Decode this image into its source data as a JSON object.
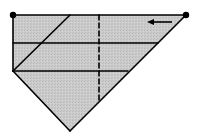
{
  "diagram": {
    "width": 198,
    "height": 138,
    "colors": {
      "background": "#ffffff",
      "fill": "#c8c8c8",
      "stroke": "#000000"
    },
    "shape": {
      "name": "pentagon-region",
      "points": [
        [
          13,
          15
        ],
        [
          186,
          15
        ],
        [
          70,
          131
        ],
        [
          13,
          71
        ]
      ]
    },
    "endpoints": [
      {
        "name": "left-endpoint-dot",
        "x": 13,
        "y": 15,
        "r": 3.2
      },
      {
        "name": "right-endpoint-dot",
        "x": 186,
        "y": 15,
        "r": 3.2
      }
    ],
    "lines": [
      {
        "name": "top-edge",
        "x1": 13,
        "y1": 15,
        "x2": 186,
        "y2": 15,
        "dashed": false
      },
      {
        "name": "left-edge",
        "x1": 13,
        "y1": 15,
        "x2": 13,
        "y2": 71,
        "dashed": false
      },
      {
        "name": "right-diagonal-edge",
        "x1": 186,
        "y1": 15,
        "x2": 70,
        "y2": 131,
        "dashed": false
      },
      {
        "name": "lower-left-diagonal-edge",
        "x1": 13,
        "y1": 71,
        "x2": 70,
        "y2": 131,
        "dashed": false
      },
      {
        "name": "horizontal-line-1",
        "x1": 13,
        "y1": 43,
        "x2": 158,
        "y2": 43,
        "dashed": false
      },
      {
        "name": "horizontal-line-2",
        "x1": 13,
        "y1": 71,
        "x2": 128,
        "y2": 71,
        "dashed": false
      },
      {
        "name": "inner-diagonal-line",
        "x1": 70,
        "y1": 15,
        "x2": 13,
        "y2": 71,
        "dashed": false
      },
      {
        "name": "vertical-dashed-line",
        "x1": 99,
        "y1": 15,
        "x2": 99,
        "y2": 100,
        "dashed": true
      }
    ],
    "arrow": {
      "name": "left-arrow",
      "direction": "left",
      "x_start": 172,
      "x_end": 147,
      "y": 22
    }
  }
}
